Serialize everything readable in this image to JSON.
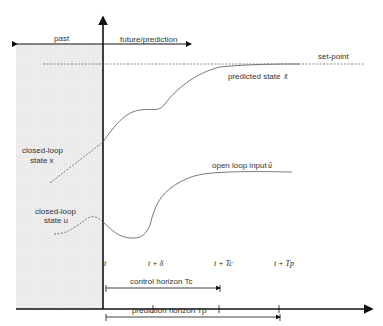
{
  "diagram": {
    "regions": {
      "past": "past",
      "future": "future/prediction"
    },
    "labels": {
      "setpoint": "set-point",
      "predicted_state": "predicted state",
      "predicted_state_symbol": "x̄",
      "closed_loop_state_x_line1": "closed-loop",
      "closed_loop_state_x_line2": "state x",
      "open_loop_input": "open loop input",
      "open_loop_input_symbol": "ū",
      "closed_loop_state_u_line1": "closed-loop",
      "closed_loop_state_u_line2": "state u"
    },
    "time_ticks": [
      "t",
      "t + δ",
      "t + Tc",
      "t + Tp"
    ],
    "horizons": {
      "control": "control horizon Tc",
      "prediction": "prediction horizon Tp"
    },
    "colors": {
      "past_shade": "#ececec",
      "axis": "#111111",
      "curve": "#555555",
      "text": "#333333"
    }
  }
}
